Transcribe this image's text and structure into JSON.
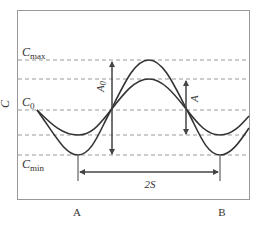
{
  "diagram": {
    "y_axis_label": "C",
    "levels": {
      "c_max": {
        "label": "C",
        "sub": "max"
      },
      "c_0": {
        "label": "C",
        "sub": "0"
      },
      "c_min": {
        "label": "C",
        "sub": "min"
      }
    },
    "amplitudes": {
      "a0": {
        "label": "A",
        "sub": "0"
      },
      "a": {
        "label": "A"
      }
    },
    "distance": {
      "label": "2S"
    },
    "points": {
      "left": "A",
      "right": "B"
    },
    "colors": {
      "curve": "#333333",
      "dashed": "#999999",
      "frame": "#999999",
      "arrow": "#444444"
    }
  }
}
